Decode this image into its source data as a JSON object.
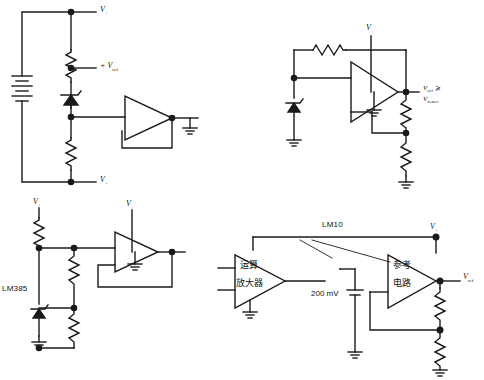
{
  "figure": {
    "kind": "circuit-diagram",
    "background_color": "#ffffff",
    "line_color": "#1a1a1a",
    "panel_count": 4,
    "width": 484,
    "height": 380
  },
  "panels": {
    "top_left": {
      "name": "zener-reference-with-buffer",
      "labels": {
        "v_plus": "V",
        "v_plus_sub": "+",
        "v_ref": "+ V",
        "v_ref_sub": "ref",
        "v_minus": "V",
        "v_minus_sub": "−"
      },
      "components": [
        "battery",
        "resistor-upper",
        "zener-diode",
        "resistor-lower",
        "op-amp-buffer",
        "ground"
      ]
    },
    "top_right": {
      "name": "zener-reference-amplified",
      "labels": {
        "v_plus": "V",
        "v_plus_sub": "+",
        "v_ref_line1": "V",
        "v_ref_line1_sub": "ref",
        "v_ref_cmp": " ⩾",
        "v_ref_line2": "V",
        "v_ref_line2_sub": "zener"
      },
      "components": [
        "resistor-feedback",
        "zener-diode",
        "op-amp",
        "resistor-divider-upper",
        "resistor-divider-lower",
        "ground-1",
        "ground-2",
        "ground-3"
      ]
    },
    "bottom_left": {
      "name": "lm385-reference",
      "labels": {
        "v_plus_supply": "V",
        "v_plus_supply_sub": "+",
        "v_plus_opamp": "V",
        "v_plus_opamp_sub": "+",
        "device": "LM385"
      },
      "components": [
        "resistor-bias",
        "lm385-shunt-reference",
        "resistor-divider-upper",
        "resistor-divider-lower",
        "op-amp-buffer",
        "ground"
      ]
    },
    "bottom_right": {
      "name": "lm10-block-diagram",
      "labels": {
        "device": "LM10",
        "v_plus": "V",
        "v_plus_sub": "+",
        "block_a_line1": "运算",
        "block_a_line2": "放大器",
        "block_b_line1": "参考",
        "block_b_line2": "电路",
        "cell_voltage": "200 mV",
        "v_ref": "V",
        "v_ref_sub": "ref"
      },
      "components": [
        "op-amp-block",
        "reference-block",
        "200mv-cell",
        "resistor-divider-upper",
        "resistor-divider-lower",
        "ground-1",
        "ground-2",
        "ground-3"
      ]
    }
  }
}
